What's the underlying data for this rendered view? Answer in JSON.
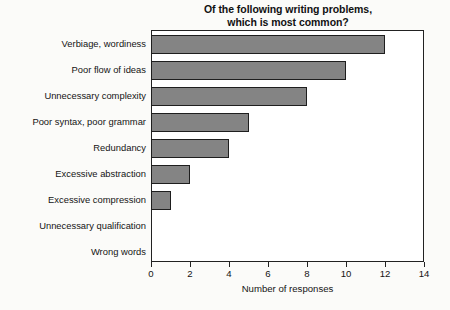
{
  "chart_data": {
    "type": "bar",
    "orientation": "horizontal",
    "title": "Of the following writing problems, which is most common?",
    "title_lines": [
      "Of the following writing problems,",
      "which is most common?"
    ],
    "categories": [
      "Verbiage, wordiness",
      "Poor flow of ideas",
      "Unnecessary complexity",
      "Poor syntax, poor grammar",
      "Redundancy",
      "Excessive abstraction",
      "Excessive compression",
      "Unnecessary qualification",
      "Wrong words"
    ],
    "values": [
      12,
      10,
      8,
      5,
      4,
      2,
      1,
      0,
      0
    ],
    "xlabel": "Number of responses",
    "ylabel": "",
    "xlim": [
      0,
      14
    ],
    "xticks": [
      0,
      2,
      4,
      6,
      8,
      10,
      12,
      14
    ],
    "xtick_labels": [
      "0",
      "2",
      "4",
      "6",
      "8",
      "10",
      "12",
      "14"
    ],
    "grid": false,
    "legend": null,
    "bar_fill_color": "#848484",
    "bar_edge_color": "#1e1e1e",
    "plot_background": "#ffffff",
    "figure_background": "#fbfbf9"
  }
}
